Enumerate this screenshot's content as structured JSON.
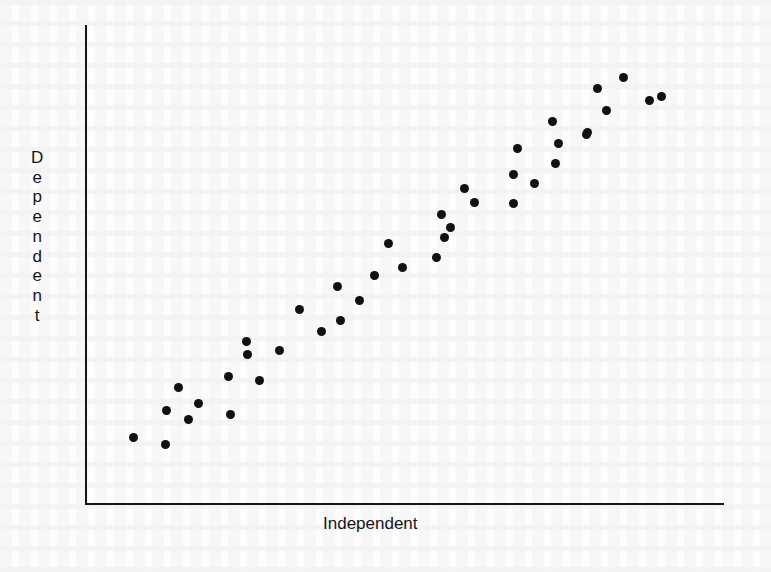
{
  "chart_data": {
    "type": "scatter",
    "title": "",
    "xlabel": "Independent",
    "ylabel": "Dependent",
    "grid": false,
    "legend": null,
    "tick_labels": {
      "x": [],
      "y": []
    },
    "xlim": [
      0,
      100
    ],
    "ylim": [
      0,
      100
    ],
    "marker": {
      "shape": "circle",
      "color": "#111115",
      "size_px": 9
    },
    "n_points": 40,
    "points": [
      {
        "x": 7.5,
        "y": 13.8
      },
      {
        "x": 12.5,
        "y": 12.3
      },
      {
        "x": 13.0,
        "y": 19.5
      },
      {
        "x": 15.0,
        "y": 25.4
      },
      {
        "x": 16.1,
        "y": 17.4
      },
      {
        "x": 18.0,
        "y": 23.3
      },
      {
        "x": 22.3,
        "y": 30.8
      },
      {
        "x": 22.7,
        "y": 23.8
      },
      {
        "x": 25.2,
        "y": 28.5
      },
      {
        "x": 25.3,
        "y": 37.7
      },
      {
        "x": 25.4,
        "y": 34.6
      },
      {
        "x": 27.2,
        "y": 41.8
      },
      {
        "x": 30.3,
        "y": 30.5
      },
      {
        "x": 33.5,
        "y": 42.5
      },
      {
        "x": 36.9,
        "y": 47.2
      },
      {
        "x": 33.5,
        "y": 37.0
      },
      {
        "x": 39.4,
        "y": 39.8
      },
      {
        "x": 36.8,
        "y": 34.2
      },
      {
        "x": 43.5,
        "y": 46.2
      },
      {
        "x": 47.4,
        "y": 43.3
      },
      {
        "x": 51.4,
        "y": 52.5
      },
      {
        "x": 55.7,
        "y": 57.4
      },
      {
        "x": 55.7,
        "y": 48.5
      },
      {
        "x": 57.2,
        "y": 64.3
      },
      {
        "x": 59.4,
        "y": 56.2
      },
      {
        "x": 61.8,
        "y": 67.0
      },
      {
        "x": 58.0,
        "y": 60.3
      },
      {
        "x": 64.5,
        "y": 62.8
      },
      {
        "x": 67.5,
        "y": 70.0
      },
      {
        "x": 67.1,
        "y": 78.5
      },
      {
        "x": 73.0,
        "y": 74.8
      },
      {
        "x": 70.8,
        "y": 82.2
      },
      {
        "x": 76.4,
        "y": 79.8
      },
      {
        "x": 73.8,
        "y": 87.3
      },
      {
        "x": 79.8,
        "y": 86.0
      },
      {
        "x": 80.3,
        "y": 92.5
      },
      {
        "x": 84.0,
        "y": 90.5
      },
      {
        "x": 85.2,
        "y": 96.2
      },
      {
        "x": 88.9,
        "y": 95.1
      },
      {
        "x": 92.5,
        "y": 92.5
      }
    ],
    "pixel_points": [
      [
        133,
        437
      ],
      [
        165,
        444
      ],
      [
        166,
        410
      ],
      [
        178,
        387
      ],
      [
        188,
        419
      ],
      [
        198,
        403
      ],
      [
        228,
        376
      ],
      [
        230,
        414
      ],
      [
        246,
        341
      ],
      [
        247,
        354
      ],
      [
        259,
        380
      ],
      [
        279,
        350
      ],
      [
        299,
        309
      ],
      [
        321,
        331
      ],
      [
        337,
        286
      ],
      [
        340,
        320
      ],
      [
        359,
        300
      ],
      [
        374,
        275
      ],
      [
        388,
        243
      ],
      [
        402,
        267
      ],
      [
        436,
        257
      ],
      [
        441,
        214
      ],
      [
        444,
        237
      ],
      [
        450,
        227
      ],
      [
        464,
        188
      ],
      [
        474,
        202
      ],
      [
        513,
        174
      ],
      [
        513,
        203
      ],
      [
        517,
        148
      ],
      [
        534,
        183
      ],
      [
        552,
        121
      ],
      [
        555,
        163
      ],
      [
        558,
        143
      ],
      [
        586,
        134
      ],
      [
        587,
        132
      ],
      [
        597,
        88
      ],
      [
        606,
        110
      ],
      [
        623,
        77
      ],
      [
        649,
        100
      ],
      [
        661,
        96
      ]
    ]
  },
  "axes": {
    "y_axis_label_chars": [
      "D",
      "e",
      "p",
      "e",
      "n",
      "d",
      "e",
      "n",
      "t"
    ],
    "x_axis_label": "Independent",
    "y_axis": {
      "x_px": 85,
      "top_px": 25,
      "bottom_px": 503
    },
    "x_axis": {
      "y_px": 503,
      "left_px": 85,
      "right_px": 724
    },
    "line_color": "#16161a",
    "background_color": "#fdfdfd"
  }
}
